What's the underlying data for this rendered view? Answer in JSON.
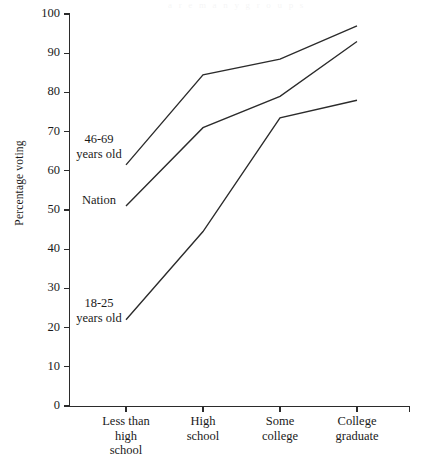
{
  "figure": {
    "bleed_text": "a  r  e  m  a  n  y  g  r  o  u  p  s"
  },
  "chart_data": {
    "type": "line",
    "title": "",
    "xlabel": "",
    "ylabel": "Percentage voting",
    "categories": [
      "Less than\nhigh\nschool",
      "High\nschool",
      "Some\ncollege",
      "College\ngraduate"
    ],
    "x_tick_labels": [
      [
        "Less than",
        "high",
        "school"
      ],
      [
        "High",
        "school"
      ],
      [
        "Some",
        "college"
      ],
      [
        "College",
        "graduate"
      ]
    ],
    "ylim": [
      0,
      100
    ],
    "y_ticks": [
      0,
      10,
      20,
      30,
      40,
      50,
      60,
      70,
      80,
      90,
      100
    ],
    "y_tick_labels": [
      "0",
      "10",
      "20",
      "30",
      "40",
      "50",
      "60",
      "70",
      "80",
      "90",
      "100"
    ],
    "grid": false,
    "legend_position": "inline-annotations",
    "series": [
      {
        "name": "46-69 years old",
        "label_lines": [
          "46-69",
          "years old"
        ],
        "values": [
          61.5,
          84.5,
          88.5,
          97
        ],
        "color": "#2b2b2b"
      },
      {
        "name": "Nation",
        "label_lines": [
          "Nation"
        ],
        "values": [
          51,
          71,
          79,
          93
        ],
        "color": "#2b2b2b"
      },
      {
        "name": "18-25 years old",
        "label_lines": [
          "18-25",
          "years old"
        ],
        "values": [
          22,
          44.5,
          73.5,
          78
        ],
        "color": "#2b2b2b"
      }
    ]
  }
}
